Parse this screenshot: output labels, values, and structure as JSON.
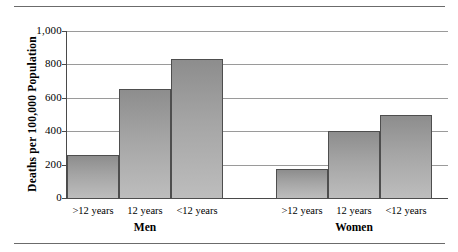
{
  "chart_data": {
    "type": "bar",
    "title": "",
    "xlabel": "",
    "ylabel": "Deaths per 100,000 Population",
    "ylim": [
      0,
      1000
    ],
    "ytick_labels": [
      "1,000",
      "800",
      "600",
      "400",
      "200",
      "0"
    ],
    "ytick_values": [
      1000,
      800,
      600,
      400,
      200,
      0
    ],
    "grid": true,
    "legend": "none",
    "groups": [
      {
        "name": "Men",
        "categories": [
          ">12 years",
          "12 years",
          "<12 years"
        ],
        "values": [
          260,
          650,
          830
        ]
      },
      {
        "name": "Women",
        "categories": [
          ">12 years",
          "12 years",
          "<12 years"
        ],
        "values": [
          175,
          400,
          500
        ]
      }
    ],
    "categories": [
      ">12 years",
      "12 years",
      "<12 years"
    ],
    "series": [
      {
        "name": "Men",
        "values": [
          260,
          650,
          830
        ]
      },
      {
        "name": "Women",
        "values": [
          175,
          400,
          500
        ]
      }
    ],
    "colors": {
      "bar_top": "#8d8d8d",
      "bar_bottom": "#bdbdbd",
      "bar_border": "#4e4e4e",
      "gridline": "#9a9a9a",
      "axis": "#4a4a4a",
      "rule": "#6b6b6b",
      "text": "#000000",
      "background": "#ffffff"
    }
  },
  "axis": {
    "y_title": "Deaths per 100,000 Population",
    "ticks": [
      {
        "label": "1,000"
      },
      {
        "label": "800"
      },
      {
        "label": "600"
      },
      {
        "label": "400"
      },
      {
        "label": "200"
      },
      {
        "label": "0"
      }
    ]
  },
  "bars": [
    {
      "label": ">12 years",
      "group": "Men",
      "value": 260
    },
    {
      "label": "12 years",
      "group": "Men",
      "value": 650
    },
    {
      "label": "<12 years",
      "group": "Men",
      "value": 830
    },
    {
      "label": ">12 years",
      "group": "Women",
      "value": 175
    },
    {
      "label": "12 years",
      "group": "Women",
      "value": 400
    },
    {
      "label": "<12 years",
      "group": "Women",
      "value": 500
    }
  ],
  "groups": [
    {
      "name": "Men"
    },
    {
      "name": "Women"
    }
  ]
}
